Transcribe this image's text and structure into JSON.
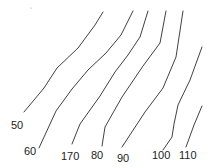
{
  "diagram": {
    "type": "contour-lines",
    "line_color": "#2a2a2a",
    "background": "#ffffff",
    "contours": [
      {
        "label": "50",
        "label_x": 11,
        "label_y": 129,
        "points": [
          [
            103,
            12
          ],
          [
            95,
            25
          ],
          [
            78,
            48
          ],
          [
            57,
            68
          ],
          [
            44,
            88
          ],
          [
            24,
            112
          ]
        ]
      },
      {
        "label": "60",
        "label_x": 24,
        "label_y": 155,
        "points": [
          [
            133,
            11
          ],
          [
            121,
            35
          ],
          [
            106,
            53
          ],
          [
            88,
            70
          ],
          [
            72,
            89
          ],
          [
            56,
            111
          ],
          [
            39,
            148
          ]
        ]
      },
      {
        "label": "170",
        "label_x": 61,
        "label_y": 160,
        "points": [
          [
            148,
            11
          ],
          [
            140,
            37
          ],
          [
            128,
            55
          ],
          [
            115,
            72
          ],
          [
            100,
            96
          ],
          [
            80,
            124
          ],
          [
            72,
            144
          ]
        ]
      },
      {
        "label": "80",
        "label_x": 91,
        "label_y": 159,
        "points": [
          [
            166,
            11
          ],
          [
            160,
            43
          ],
          [
            143,
            66
          ],
          [
            122,
            97
          ],
          [
            105,
            127
          ],
          [
            102,
            146
          ]
        ]
      },
      {
        "label": "90",
        "label_x": 117,
        "label_y": 162,
        "points": [
          [
            183,
            11
          ],
          [
            176,
            57
          ],
          [
            163,
            88
          ],
          [
            145,
            112
          ],
          [
            122,
            147
          ]
        ]
      },
      {
        "label": "100",
        "label_x": 152,
        "label_y": 159,
        "points": [
          [
            202,
            47
          ],
          [
            190,
            80
          ],
          [
            178,
            105
          ],
          [
            174,
            124
          ],
          [
            172,
            137
          ],
          [
            163,
            150
          ]
        ]
      },
      {
        "label": "110",
        "label_x": 179,
        "label_y": 159,
        "points": [
          [
            202,
            106
          ],
          [
            194,
            125
          ],
          [
            186,
            147
          ]
        ]
      }
    ],
    "stray_marks": [
      [
        31,
        8
      ]
    ]
  }
}
